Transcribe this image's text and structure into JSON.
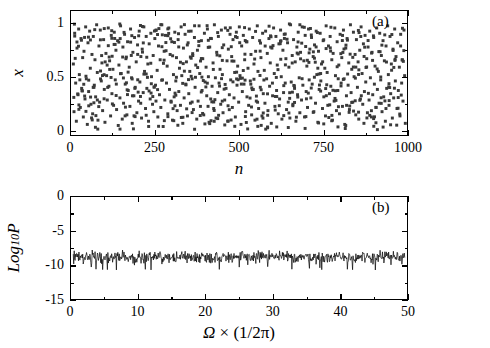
{
  "figure": {
    "background": "#ffffff",
    "foreground": "#000000",
    "marker_color": "#3a3a3a"
  },
  "chart_data": [
    {
      "id": "panel-a",
      "type": "scatter",
      "title": "",
      "panel_label": "(a)",
      "xlabel": "n",
      "ylabel": "x",
      "xlim": [
        0,
        1000
      ],
      "ylim": [
        -0.05,
        1.12
      ],
      "xticks": [
        0,
        250,
        500,
        750,
        1000
      ],
      "xtick_labels": [
        "0",
        "250",
        "500",
        "750",
        "1000"
      ],
      "xticks_minor": [
        125,
        375,
        625,
        875
      ],
      "yticks": [
        0,
        0.5,
        1
      ],
      "ytick_labels": [
        "0",
        "0.5",
        "1"
      ],
      "yticks_minor": [
        0.25,
        0.75
      ],
      "grid": false,
      "legend": false,
      "marker": "square",
      "marker_size": 3,
      "n_points": 600,
      "description": "Chaotic time series: x_n scattered over full range 0 to 1 for n = 0..1000",
      "x": [
        2,
        4,
        6,
        9,
        11,
        13,
        16,
        18,
        20,
        23,
        25,
        27,
        30,
        32,
        34,
        37,
        39,
        41,
        44,
        46,
        48,
        51,
        53,
        55,
        58,
        60,
        62,
        65,
        67,
        69,
        72,
        74,
        76,
        79,
        81,
        83,
        86,
        88,
        90,
        93,
        95,
        97,
        100,
        102,
        104,
        107,
        109,
        111,
        114,
        116,
        118,
        121,
        123,
        125,
        128,
        130,
        132,
        135,
        137,
        139,
        142,
        144,
        146,
        149,
        151,
        153,
        156,
        158,
        160,
        163,
        165,
        167,
        170,
        172,
        174,
        177,
        179,
        181,
        184,
        186,
        188,
        191,
        193,
        195,
        198,
        200,
        202,
        205,
        207,
        209,
        212,
        214,
        216,
        219,
        221,
        223,
        226,
        228,
        230,
        233,
        235,
        237,
        240,
        242,
        244,
        247,
        249,
        251,
        254,
        256,
        258,
        261,
        263,
        265,
        268,
        270,
        272,
        275,
        277,
        279,
        282,
        284,
        286,
        289,
        291,
        293,
        296,
        298,
        300,
        303,
        305,
        307,
        310,
        312,
        314,
        317,
        319,
        321,
        324,
        326,
        328,
        331,
        333,
        335,
        338,
        340,
        342,
        345,
        347,
        349,
        352,
        354,
        356,
        359,
        361,
        363,
        366,
        368,
        370,
        373,
        375,
        377,
        380,
        382,
        384,
        387,
        389,
        391,
        394,
        396,
        398,
        401,
        403,
        405,
        408,
        410,
        412,
        415,
        417,
        419,
        422,
        424,
        426,
        429,
        431,
        433,
        436,
        438,
        440,
        443,
        445,
        447,
        450,
        452,
        454,
        457,
        459,
        461,
        464,
        466,
        468,
        471,
        473,
        475,
        478,
        480,
        482,
        485,
        487,
        489,
        492,
        494,
        496,
        499,
        501,
        503,
        506,
        508,
        510,
        513,
        515,
        517,
        520,
        522,
        524,
        527,
        529,
        531,
        534,
        536,
        538,
        541,
        543,
        545,
        548,
        550,
        552,
        555,
        557,
        559,
        562,
        564,
        566,
        569,
        571,
        573,
        576,
        578,
        580,
        583,
        585,
        587,
        590,
        592,
        594,
        597,
        599,
        601,
        604,
        606,
        608,
        611,
        613,
        615,
        618,
        620,
        622,
        625,
        627,
        629,
        632,
        634,
        636,
        639,
        641,
        643,
        646,
        648,
        650,
        653,
        655,
        657,
        660,
        662,
        664,
        667,
        669,
        671,
        674,
        676,
        678,
        681,
        683,
        685,
        688,
        690,
        692,
        695,
        697,
        699,
        702,
        704,
        706,
        709,
        711,
        713,
        716,
        718,
        720,
        723,
        725,
        727,
        730,
        732,
        734,
        737,
        739,
        741,
        744,
        746,
        748,
        751,
        753,
        755,
        758,
        760,
        762,
        765,
        767,
        769,
        772,
        774,
        776,
        779,
        781,
        783,
        786,
        788,
        790,
        793,
        795,
        797,
        800,
        802,
        804,
        807,
        809,
        811,
        814,
        816,
        818,
        821,
        823,
        825,
        828,
        830,
        832,
        835,
        837,
        839,
        842,
        844,
        846,
        849,
        851,
        853,
        856,
        858,
        860,
        863,
        865,
        867,
        870,
        872,
        874,
        877,
        879,
        881,
        884,
        886,
        888,
        891,
        893,
        895,
        898,
        900,
        902,
        905,
        907,
        909,
        912,
        914,
        916,
        919,
        921,
        923,
        926,
        928,
        930,
        933,
        935,
        937,
        940,
        942,
        944,
        947,
        949,
        951,
        954,
        956,
        958,
        961,
        963,
        965,
        968,
        970,
        972,
        975,
        977,
        979,
        982,
        984,
        986,
        989,
        991,
        993,
        996,
        998,
        1000
      ],
      "y": [
        0.62,
        0.17,
        0.91,
        0.44,
        0.08,
        0.77,
        0.33,
        0.95,
        0.52,
        0.21,
        0.86,
        0.39,
        0.68,
        0.12,
        0.74,
        0.29,
        0.97,
        0.48,
        0.05,
        0.82,
        0.36,
        0.93,
        0.58,
        0.24,
        0.71,
        0.15,
        0.88,
        0.42,
        0.66,
        0.31,
        0.99,
        0.54,
        0.09,
        0.79,
        0.26,
        0.94,
        0.46,
        0.63,
        0.18,
        0.85,
        0.38,
        0.07,
        0.72,
        0.51,
        0.28,
        0.96,
        0.41,
        0.65,
        0.13,
        0.89,
        0.34,
        0.57,
        0.23,
        0.92,
        0.47,
        0.75,
        0.19,
        0.84,
        0.04,
        0.61,
        0.3,
        0.98,
        0.53,
        0.1,
        0.78,
        0.25,
        0.9,
        0.43,
        0.67,
        0.14,
        0.83,
        0.37,
        0.59,
        0.22,
        0.95,
        0.49,
        0.06,
        0.73,
        0.32,
        0.87,
        0.4,
        0.64,
        0.16,
        0.8,
        0.27,
        0.93,
        0.45,
        0.69,
        0.11,
        0.76,
        0.35,
        0.97,
        0.55,
        0.2,
        0.88,
        0.39,
        0.62,
        0.08,
        0.81,
        0.29,
        0.91,
        0.5,
        0.24,
        0.7,
        0.17,
        0.86,
        0.42,
        0.94,
        0.56,
        0.12,
        0.79,
        0.33,
        0.66,
        0.21,
        0.99,
        0.47,
        0.03,
        0.74,
        0.28,
        0.89,
        0.44,
        0.6,
        0.15,
        0.96,
        0.38,
        0.71,
        0.26,
        0.83,
        0.09,
        0.52,
        0.31,
        0.92,
        0.46,
        0.68,
        0.18,
        0.85,
        0.36,
        0.58,
        0.23,
        0.97,
        0.51,
        0.06,
        0.77,
        0.3,
        0.9,
        0.43,
        0.64,
        0.13,
        0.82,
        0.34,
        0.55,
        0.25,
        0.93,
        0.48,
        0.7,
        0.19,
        0.87,
        0.4,
        0.61,
        0.1,
        0.75,
        0.27,
        0.98,
        0.53,
        0.22,
        0.84,
        0.37,
        0.67,
        0.14,
        0.91,
        0.45,
        0.59,
        0.32,
        0.95,
        0.5,
        0.07,
        0.78,
        0.29,
        0.86,
        0.41,
        0.63,
        0.2,
        0.99,
        0.49,
        0.11,
        0.73,
        0.35,
        0.88,
        0.44,
        0.57,
        0.24,
        0.94,
        0.52,
        0.16,
        0.8,
        0.28,
        0.96,
        0.39,
        0.65,
        0.08,
        0.76,
        0.33,
        0.9,
        0.47,
        0.69,
        0.21,
        0.85,
        0.3,
        0.54,
        0.12,
        0.92,
        0.42,
        0.6,
        0.26,
        0.97,
        0.51,
        0.05,
        0.79,
        0.36,
        0.89,
        0.43,
        0.66,
        0.17,
        0.83,
        0.31,
        0.58,
        0.23,
        0.95,
        0.46,
        0.71,
        0.14,
        0.87,
        0.38,
        0.62,
        0.09,
        0.74,
        0.27,
        0.98,
        0.55,
        0.2,
        0.84,
        0.4,
        0.68,
        0.13,
        0.91,
        0.34,
        0.56,
        0.25,
        0.93,
        0.48,
        0.72,
        0.18,
        0.86,
        0.41,
        0.63,
        0.06,
        0.77,
        0.32,
        0.96,
        0.53,
        0.22,
        0.88,
        0.37,
        0.61,
        0.15,
        0.81,
        0.29,
        0.94,
        0.5,
        0.1,
        0.75,
        0.35,
        0.9,
        0.44,
        0.67,
        0.19,
        0.82,
        0.26,
        0.59,
        0.11,
        0.99,
        0.45,
        0.7,
        0.24,
        0.85,
        0.39,
        0.64,
        0.08,
        0.78,
        0.33,
        0.92,
        0.49,
        0.16,
        0.73,
        0.28,
        0.97,
        0.42,
        0.65,
        0.12,
        0.89,
        0.36,
        0.6,
        0.21,
        0.95,
        0.47,
        0.76,
        0.3,
        0.87,
        0.43,
        0.69,
        0.17,
        0.8,
        0.25,
        0.93,
        0.52,
        0.07,
        0.74,
        0.38,
        0.91,
        0.46,
        0.62,
        0.2,
        0.84,
        0.31,
        0.58,
        0.13,
        0.98,
        0.54,
        0.23,
        0.79,
        0.34,
        0.88,
        0.41,
        0.66,
        0.09,
        0.72,
        0.27,
        0.96,
        0.51,
        0.18,
        0.83,
        0.37,
        0.61,
        0.15,
        0.9,
        0.44,
        0.68,
        0.22,
        0.94,
        0.48,
        0.05,
        0.77,
        0.32,
        0.86,
        0.42,
        0.63,
        0.19,
        0.99,
        0.35,
        0.57,
        0.26,
        0.92,
        0.5,
        0.71,
        0.14,
        0.85,
        0.4,
        0.64,
        0.1,
        0.75,
        0.29,
        0.97,
        0.53,
        0.24,
        0.81,
        0.36,
        0.89,
        0.45,
        0.67,
        0.16,
        0.78,
        0.28,
        0.93,
        0.49,
        0.12,
        0.73,
        0.33,
        0.87,
        0.43,
        0.6,
        0.21,
        0.96,
        0.38,
        0.55,
        0.25,
        0.91,
        0.47,
        0.7,
        0.17,
        0.84,
        0.31,
        0.65,
        0.08,
        0.79,
        0.39,
        0.98,
        0.52,
        0.23,
        0.88,
        0.34,
        0.62,
        0.11,
        0.76,
        0.3,
        0.95,
        0.46,
        0.69,
        0.2,
        0.82,
        0.37,
        0.59,
        0.13,
        0.9,
        0.44,
        0.66,
        0.27,
        0.94,
        0.51,
        0.06,
        0.74,
        0.35,
        0.85,
        0.41,
        0.68,
        0.18,
        0.8,
        0.32,
        0.97,
        0.56,
        0.22,
        0.83,
        0.4,
        0.63,
        0.15,
        0.92,
        0.48,
        0.71,
        0.26,
        0.87,
        0.36,
        0.58,
        0.09,
        0.77,
        0.43,
        0.99,
        0.53,
        0.19,
        0.86,
        0.33,
        0.61,
        0.12,
        0.72,
        0.29,
        0.94,
        0.5
      ]
    },
    {
      "id": "panel-b",
      "type": "line",
      "title": "",
      "panel_label": "(b)",
      "xlabel": "Ω × (1/2π)",
      "ylabel": "Log₁₀P",
      "xlim": [
        0,
        50
      ],
      "ylim": [
        -15,
        0
      ],
      "xticks": [
        0,
        10,
        20,
        30,
        40,
        50
      ],
      "xtick_labels": [
        "0",
        "10",
        "20",
        "30",
        "40",
        "50"
      ],
      "xticks_minor": [
        5,
        15,
        25,
        35,
        45
      ],
      "yticks": [
        -15,
        -10,
        -5,
        0
      ],
      "ytick_labels": [
        "-15",
        "-10",
        "-5",
        "0"
      ],
      "yticks_minor": [
        -12.5,
        -7.5,
        -2.5
      ],
      "grid": false,
      "legend": false,
      "line_color": "#000000",
      "line_width": 0.7,
      "description": "Broadband flat power spectrum, noisy, mean level about -8.8, fluctuating roughly between -10.5 and -7.4 across the full frequency range",
      "mean_level": -8.8,
      "band_min": -10.8,
      "band_max": -7.3,
      "n_samples": 700
    }
  ],
  "labels": {
    "panel_a_tag": "(a)",
    "panel_b_tag": "(b)",
    "x_axis_a": "n",
    "y_axis_a": "x",
    "y_axis_b_main": "Log",
    "y_axis_b_sub": "10",
    "y_axis_b_tail": "P",
    "x_axis_b_omega": "Ω",
    "x_axis_b_rest": " × (1/2π)"
  }
}
